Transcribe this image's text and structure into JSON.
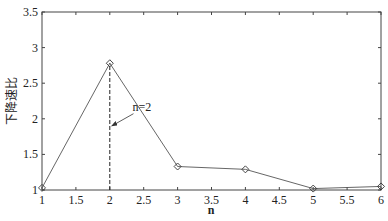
{
  "chart_data": {
    "type": "line",
    "title": "",
    "xlabel": "n",
    "ylabel": "下降速比",
    "xlim": [
      1,
      6
    ],
    "ylim": [
      1,
      3.5
    ],
    "xticks": [
      1,
      1.5,
      2,
      2.5,
      3,
      3.5,
      4,
      4.5,
      5,
      5.5,
      6
    ],
    "xtick_labels": [
      "1",
      "1.5",
      "2",
      "2.5",
      "3",
      "3.5",
      "4",
      "4.5",
      "5",
      "5.5",
      "6"
    ],
    "yticks": [
      1,
      1.5,
      2,
      2.5,
      3,
      3.5
    ],
    "ytick_labels": [
      "1",
      "1.5",
      "2",
      "2.5",
      "3",
      "3.5"
    ],
    "grid": false,
    "legend": null,
    "series": [
      {
        "name": "下降速比",
        "marker": "diamond",
        "color": "#555555",
        "x": [
          1,
          2,
          3,
          4,
          5,
          6
        ],
        "values": [
          1.03,
          2.78,
          1.33,
          1.29,
          1.02,
          1.05
        ]
      }
    ],
    "annotations": [
      {
        "type": "vline",
        "x": 2,
        "y_from": 1,
        "y_to": 2.78,
        "style": "dashed"
      },
      {
        "type": "arrow",
        "text": "n=2",
        "text_x": 2.32,
        "text_y": 2.1,
        "target_x": 2.0,
        "target_y": 1.9
      }
    ]
  },
  "labels": {
    "xlabel": "n",
    "ylabel": "下降速比",
    "annotation": "n=2"
  }
}
